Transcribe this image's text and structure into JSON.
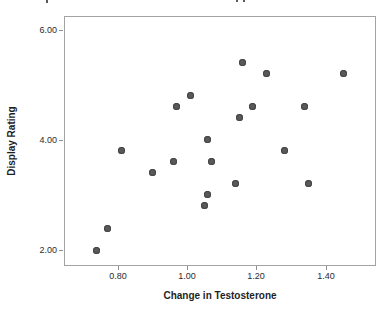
{
  "figure": {
    "background": "#ffffff",
    "frame_color": "#a3a3a3",
    "tick_color": "#8f8f8f",
    "tick_label_color": "#2b2b2b",
    "axis_title_color": "#1f1f1f",
    "top_edge_artifacts": [
      {
        "x": 46,
        "w": 2,
        "h": 3
      },
      {
        "x": 236,
        "w": 2,
        "h": 2
      },
      {
        "x": 243,
        "w": 2,
        "h": 2
      }
    ]
  },
  "chart_data": {
    "type": "scatter",
    "title": "",
    "xlabel": "Change in Testosterone",
    "ylabel": "Display Rating",
    "xlim": [
      0.645,
      1.545
    ],
    "ylim": [
      1.71,
      6.25
    ],
    "grid": false,
    "legend": "none",
    "x_ticks": [
      {
        "value": 0.8,
        "label": "0.80"
      },
      {
        "value": 1.0,
        "label": "1.00"
      },
      {
        "value": 1.2,
        "label": "1.20"
      },
      {
        "value": 1.4,
        "label": "1.40"
      }
    ],
    "y_ticks": [
      {
        "value": 2.0,
        "label": "2.00"
      },
      {
        "value": 4.0,
        "label": "4.00"
      },
      {
        "value": 6.0,
        "label": "6.00"
      }
    ],
    "marker": {
      "shape": "circle",
      "diameter_px": 7,
      "fill": "#595959",
      "stroke": "#454545"
    },
    "points": [
      {
        "x": 0.74,
        "y": 2.0
      },
      {
        "x": 0.77,
        "y": 2.4
      },
      {
        "x": 0.81,
        "y": 3.8
      },
      {
        "x": 0.9,
        "y": 3.4
      },
      {
        "x": 0.96,
        "y": 3.6
      },
      {
        "x": 0.97,
        "y": 4.6
      },
      {
        "x": 1.01,
        "y": 4.8
      },
      {
        "x": 1.05,
        "y": 2.8
      },
      {
        "x": 1.06,
        "y": 3.0
      },
      {
        "x": 1.06,
        "y": 4.0
      },
      {
        "x": 1.07,
        "y": 3.6
      },
      {
        "x": 1.14,
        "y": 3.2
      },
      {
        "x": 1.15,
        "y": 4.4
      },
      {
        "x": 1.16,
        "y": 5.4
      },
      {
        "x": 1.19,
        "y": 4.6
      },
      {
        "x": 1.23,
        "y": 5.2
      },
      {
        "x": 1.28,
        "y": 3.8
      },
      {
        "x": 1.34,
        "y": 4.6
      },
      {
        "x": 1.35,
        "y": 3.2
      },
      {
        "x": 1.45,
        "y": 5.2
      }
    ]
  }
}
